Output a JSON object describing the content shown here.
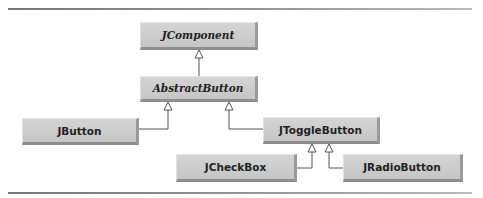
{
  "diagram": {
    "type": "class-hierarchy",
    "nodes": {
      "jcomponent": {
        "label": "JComponent",
        "abstract_style": true
      },
      "abstractbutton": {
        "label": "AbstractButton",
        "abstract_style": true
      },
      "jbutton": {
        "label": "JButton"
      },
      "jtogglebutton": {
        "label": "JToggleButton"
      },
      "jcheckbox": {
        "label": "JCheckBox"
      },
      "jradiobutton": {
        "label": "JRadioButton"
      }
    },
    "edges": [
      {
        "from": "AbstractButton",
        "to": "JComponent",
        "kind": "inheritance"
      },
      {
        "from": "JButton",
        "to": "AbstractButton",
        "kind": "inheritance"
      },
      {
        "from": "JToggleButton",
        "to": "AbstractButton",
        "kind": "inheritance"
      },
      {
        "from": "JCheckBox",
        "to": "JToggleButton",
        "kind": "inheritance"
      },
      {
        "from": "JRadioButton",
        "to": "JToggleButton",
        "kind": "inheritance"
      }
    ]
  }
}
